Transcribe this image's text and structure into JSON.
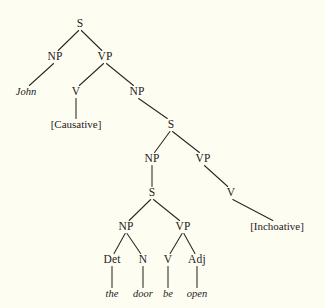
{
  "figure": {
    "kind": "syntax-tree",
    "background_color": "#fefdf2",
    "ink_color": "#24211c",
    "width": 325,
    "height": 308
  },
  "chart_data": {
    "type": "diagram",
    "subtype": "linguistic-phrase-structure-tree",
    "title": "",
    "sentence": "John [Causative] the door be open [Inchoative]",
    "terminal_string": "the door be open",
    "nodes": [
      {
        "id": "s1",
        "label": "S",
        "style": "category",
        "x": 80,
        "y": 27
      },
      {
        "id": "np1",
        "label": "NP",
        "style": "category",
        "x": 55,
        "y": 60
      },
      {
        "id": "vp1",
        "label": "VP",
        "style": "category",
        "x": 105,
        "y": 60
      },
      {
        "id": "john",
        "label": "John",
        "style": "terminal",
        "x": 26,
        "y": 95
      },
      {
        "id": "v1",
        "label": "V",
        "style": "category",
        "x": 76,
        "y": 95
      },
      {
        "id": "np2",
        "label": "NP",
        "style": "category",
        "x": 137,
        "y": 95
      },
      {
        "id": "causative",
        "label": "[Causative]",
        "style": "bracketed",
        "x": 76,
        "y": 128
      },
      {
        "id": "s2",
        "label": "S",
        "style": "category",
        "x": 171,
        "y": 128
      },
      {
        "id": "np3",
        "label": "NP",
        "style": "category",
        "x": 152,
        "y": 162
      },
      {
        "id": "vp2",
        "label": "VP",
        "style": "category",
        "x": 203,
        "y": 162
      },
      {
        "id": "s3",
        "label": "S",
        "style": "category",
        "x": 152,
        "y": 196
      },
      {
        "id": "v2",
        "label": "V",
        "style": "category",
        "x": 231,
        "y": 196
      },
      {
        "id": "np4",
        "label": "NP",
        "style": "category",
        "x": 126,
        "y": 230
      },
      {
        "id": "vp3",
        "label": "VP",
        "style": "category",
        "x": 183,
        "y": 230
      },
      {
        "id": "inchoative",
        "label": "[Inchoative]",
        "style": "bracketed",
        "x": 277,
        "y": 230
      },
      {
        "id": "det",
        "label": "Det",
        "style": "category",
        "x": 112,
        "y": 263
      },
      {
        "id": "n",
        "label": "N",
        "style": "category",
        "x": 143,
        "y": 263
      },
      {
        "id": "v3",
        "label": "V",
        "style": "category",
        "x": 168,
        "y": 263
      },
      {
        "id": "adj",
        "label": "Adj",
        "style": "category",
        "x": 197,
        "y": 263
      },
      {
        "id": "the",
        "label": "the",
        "style": "terminal",
        "x": 112,
        "y": 297
      },
      {
        "id": "door",
        "label": "door",
        "style": "terminal",
        "x": 143,
        "y": 297
      },
      {
        "id": "be",
        "label": "be",
        "style": "terminal",
        "x": 168,
        "y": 297
      },
      {
        "id": "open",
        "label": "open",
        "style": "terminal",
        "x": 197,
        "y": 297
      }
    ],
    "edges": [
      {
        "from": "s1",
        "to": "np1"
      },
      {
        "from": "s1",
        "to": "vp1"
      },
      {
        "from": "np1",
        "to": "john"
      },
      {
        "from": "vp1",
        "to": "v1"
      },
      {
        "from": "vp1",
        "to": "np2"
      },
      {
        "from": "v1",
        "to": "causative"
      },
      {
        "from": "np2",
        "to": "s2"
      },
      {
        "from": "s2",
        "to": "np3"
      },
      {
        "from": "s2",
        "to": "vp2"
      },
      {
        "from": "np3",
        "to": "s3"
      },
      {
        "from": "vp2",
        "to": "v2"
      },
      {
        "from": "s3",
        "to": "np4"
      },
      {
        "from": "s3",
        "to": "vp3"
      },
      {
        "from": "v2",
        "to": "inchoative"
      },
      {
        "from": "np4",
        "to": "det"
      },
      {
        "from": "np4",
        "to": "n"
      },
      {
        "from": "vp3",
        "to": "v3"
      },
      {
        "from": "vp3",
        "to": "adj"
      },
      {
        "from": "det",
        "to": "the"
      },
      {
        "from": "n",
        "to": "door"
      },
      {
        "from": "v3",
        "to": "be"
      },
      {
        "from": "adj",
        "to": "open"
      }
    ],
    "legend": [],
    "annotations": [
      {
        "text": "[Causative]",
        "meaning": "abstract causative predicate"
      },
      {
        "text": "[Inchoative]",
        "meaning": "abstract inchoative predicate"
      }
    ]
  },
  "page_artifact": {
    "clipped_text": "",
    "visible": false
  }
}
